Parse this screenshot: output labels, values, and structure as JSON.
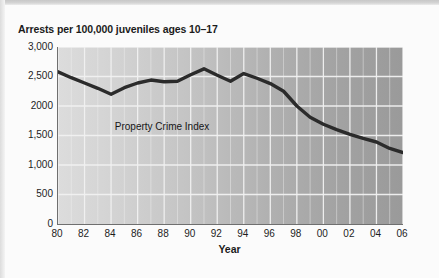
{
  "figure": {
    "title": "Arrests per 100,000 juveniles ages 10–17",
    "x_axis_title": "Year",
    "series_label": "Property Crime Index"
  },
  "axes": {
    "y_tick_labels": [
      "3,000",
      "2,500",
      "2000",
      "1,500",
      "1,000",
      "500",
      "0"
    ],
    "x_tick_labels": [
      "80",
      "82",
      "84",
      "86",
      "88",
      "90",
      "92",
      "94",
      "96",
      "98",
      "00",
      "02",
      "04",
      "06"
    ]
  },
  "colors": {
    "line": "#2b2b2b",
    "gridline": "#f2f2f2",
    "axis": "#6f6f6f",
    "plot_fill_left": "#dcdcdc",
    "plot_fill_right": "#9a9a9a",
    "text": "#1b1b1b",
    "page_background": "#fbfbfb"
  },
  "chart_data": {
    "type": "line",
    "title": "Arrests per 100,000 juveniles ages 10–17",
    "xlabel": "Year",
    "ylabel": "",
    "xlim": [
      1980,
      2006
    ],
    "ylim": [
      0,
      3000
    ],
    "ytick_values": [
      0,
      500,
      1000,
      1500,
      2000,
      2500,
      3000
    ],
    "xtick_values": [
      1980,
      1982,
      1984,
      1986,
      1988,
      1990,
      1992,
      1994,
      1996,
      1998,
      2000,
      2002,
      2004,
      2006
    ],
    "grid": true,
    "legend": "none",
    "annotations": [
      {
        "text": "Property Crime Index",
        "x": 1988.5,
        "y": 1620
      }
    ],
    "series": [
      {
        "name": "Property Crime Index",
        "x": [
          1980,
          1981,
          1982,
          1983,
          1984,
          1985,
          1986,
          1987,
          1988,
          1989,
          1990,
          1991,
          1992,
          1993,
          1994,
          1995,
          1996,
          1997,
          1998,
          1999,
          2000,
          2001,
          2002,
          2003,
          2004,
          2005,
          2006
        ],
        "values": [
          2580,
          2480,
          2390,
          2300,
          2200,
          2310,
          2390,
          2440,
          2410,
          2420,
          2530,
          2630,
          2520,
          2420,
          2550,
          2470,
          2380,
          2250,
          2000,
          1810,
          1690,
          1600,
          1520,
          1450,
          1390,
          1280,
          1210
        ]
      }
    ]
  }
}
